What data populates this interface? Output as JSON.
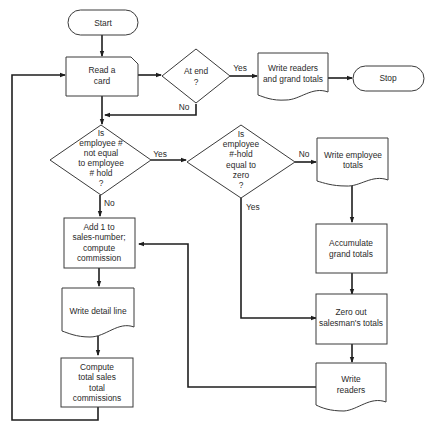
{
  "diagram": {
    "type": "flowchart",
    "nodes": {
      "start": {
        "shape": "terminal",
        "lines": [
          "Start"
        ]
      },
      "read_card": {
        "shape": "input-card",
        "lines": [
          "Read a",
          "card"
        ]
      },
      "at_end": {
        "shape": "decision",
        "lines": [
          "At end",
          "?"
        ]
      },
      "write_readers_grand": {
        "shape": "document",
        "lines": [
          "Write readers",
          "and grand totals"
        ]
      },
      "stop": {
        "shape": "terminal",
        "lines": [
          "Stop"
        ]
      },
      "emp_not_equal": {
        "shape": "decision",
        "lines": [
          "Is",
          "employee #",
          "not equal",
          "to employee",
          "# hold",
          "?"
        ]
      },
      "hold_zero": {
        "shape": "decision",
        "lines": [
          "Is",
          "employee",
          "#-hold",
          "equal to",
          "zero",
          "?"
        ]
      },
      "write_emp_totals": {
        "shape": "document",
        "lines": [
          "Write employee",
          "totals"
        ]
      },
      "add_one": {
        "shape": "process",
        "lines": [
          "Add 1 to",
          "sales-number;",
          "compute",
          "commission"
        ]
      },
      "accumulate": {
        "shape": "process",
        "lines": [
          "Accumulate",
          "grand totals"
        ]
      },
      "write_detail": {
        "shape": "document",
        "lines": [
          "Write detail line"
        ]
      },
      "zero_out": {
        "shape": "process",
        "lines": [
          "Zero out",
          "salesman's totals"
        ]
      },
      "compute_totals": {
        "shape": "process",
        "lines": [
          "Compute",
          "total sales",
          "total",
          "commissions"
        ]
      },
      "write_readers": {
        "shape": "document",
        "lines": [
          "Write",
          "readers"
        ]
      }
    },
    "edge_labels": {
      "at_end_yes": "Yes",
      "at_end_no": "No",
      "emp_yes": "Yes",
      "emp_no": "No",
      "zero_no": "No",
      "zero_yes": "Yes"
    },
    "edges": [
      [
        "start",
        "read_card"
      ],
      [
        "read_card",
        "at_end"
      ],
      [
        "at_end",
        "write_readers_grand",
        "Yes"
      ],
      [
        "write_readers_grand",
        "stop"
      ],
      [
        "at_end",
        "emp_not_equal",
        "No"
      ],
      [
        "emp_not_equal",
        "hold_zero",
        "Yes"
      ],
      [
        "emp_not_equal",
        "add_one",
        "No"
      ],
      [
        "hold_zero",
        "write_emp_totals",
        "No"
      ],
      [
        "hold_zero",
        "zero_out",
        "Yes"
      ],
      [
        "write_emp_totals",
        "accumulate"
      ],
      [
        "accumulate",
        "zero_out"
      ],
      [
        "zero_out",
        "write_readers"
      ],
      [
        "write_readers",
        "add_one"
      ],
      [
        "add_one",
        "write_detail"
      ],
      [
        "write_detail",
        "compute_totals"
      ],
      [
        "compute_totals",
        "read_card"
      ]
    ]
  }
}
